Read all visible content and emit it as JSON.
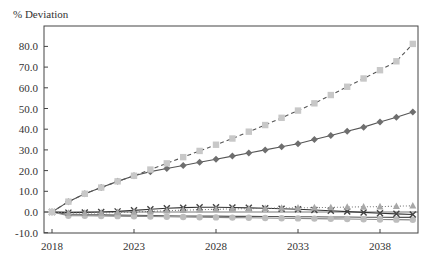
{
  "chart_data": {
    "type": "line",
    "title": "",
    "ylabel": "% Deviation",
    "xlabel": "",
    "ylim": [
      -10,
      90
    ],
    "xlim": [
      2017.5,
      2040.6
    ],
    "yticks": [
      -10,
      0,
      10,
      20,
      30,
      40,
      50,
      60,
      70,
      80
    ],
    "ytick_labels": [
      "-10.0",
      "0.0",
      "10.0",
      "20.0",
      "30.0",
      "40.0",
      "50.0",
      "60.0",
      "70.0",
      "80.0"
    ],
    "xticks": [
      2018,
      2023,
      2028,
      2033,
      2038
    ],
    "xtick_labels": [
      "2018",
      "2023",
      "2028",
      "2033",
      "2038"
    ],
    "grid": false,
    "legend": "none",
    "x": [
      2018,
      2019,
      2020,
      2021,
      2022,
      2023,
      2024,
      2025,
      2026,
      2027,
      2028,
      2029,
      2030,
      2031,
      2032,
      2033,
      2034,
      2035,
      2036,
      2037,
      2038,
      2039,
      2040
    ],
    "series": [
      {
        "name": "Series A (light squares, dashed)",
        "color": "#c8c8c8",
        "line_color": "#555555",
        "dash": "4,3",
        "marker": "square",
        "values": [
          0.0,
          5.0,
          8.8,
          11.8,
          14.8,
          17.5,
          20.5,
          23.5,
          26.5,
          29.5,
          32.5,
          35.5,
          38.8,
          42.0,
          45.5,
          49.0,
          52.5,
          56.5,
          60.5,
          64.5,
          68.5,
          72.8,
          81.2
        ]
      },
      {
        "name": "Series B (dark diamonds, solid)",
        "color": "#6e6e6e",
        "line_color": "#555555",
        "dash": "",
        "marker": "diamond",
        "values": [
          0.0,
          5.0,
          8.8,
          11.8,
          14.8,
          17.5,
          19.5,
          21.0,
          22.5,
          24.0,
          25.5,
          27.0,
          28.5,
          30.0,
          31.5,
          33.0,
          35.0,
          37.0,
          39.0,
          41.0,
          43.5,
          45.8,
          48.3
        ]
      },
      {
        "name": "Series C (triangles, dotted)",
        "color": "#a8a8a8",
        "line_color": "#777777",
        "dash": "1,2",
        "marker": "triangle",
        "values": [
          0.0,
          -0.5,
          -0.5,
          -0.4,
          -0.2,
          0.0,
          0.3,
          0.6,
          0.9,
          1.1,
          1.3,
          1.5,
          1.6,
          1.8,
          1.9,
          2.0,
          2.1,
          2.2,
          2.4,
          2.5,
          2.6,
          2.8,
          3.0
        ]
      },
      {
        "name": "Series D (X markers, solid dark)",
        "color": "#444444",
        "line_color": "#333333",
        "dash": "",
        "marker": "x",
        "values": [
          0.0,
          -0.3,
          -0.2,
          0.0,
          0.3,
          0.8,
          1.3,
          1.8,
          2.1,
          2.3,
          2.3,
          2.2,
          2.0,
          1.8,
          1.6,
          1.3,
          1.0,
          0.6,
          0.2,
          -0.2,
          -0.6,
          -0.9,
          -1.2
        ]
      },
      {
        "name": "Series E (light circles, solid)",
        "color": "#bdbdbd",
        "line_color": "#888888",
        "dash": "",
        "marker": "circle",
        "values": [
          0.0,
          -1.8,
          -1.8,
          -1.9,
          -2.0,
          -2.1,
          -2.2,
          -2.3,
          -2.4,
          -2.5,
          -2.6,
          -2.7,
          -2.8,
          -2.9,
          -3.0,
          -3.1,
          -3.2,
          -3.3,
          -3.4,
          -3.5,
          -3.6,
          -3.7,
          -3.8
        ]
      },
      {
        "name": "Series F (dark line)",
        "color": "#555555",
        "line_color": "#555555",
        "dash": "",
        "marker": "none",
        "values": [
          0.0,
          -1.2,
          -1.3,
          -1.4,
          -1.5,
          -1.6,
          -1.7,
          -1.8,
          -1.9,
          -2.0,
          -2.0,
          -2.1,
          -2.1,
          -2.2,
          -2.2,
          -2.3,
          -2.3,
          -2.4,
          -2.4,
          -2.5,
          -2.5,
          -2.6,
          -2.6
        ]
      }
    ]
  },
  "labels": {
    "y_axis_title": "% Deviation"
  }
}
